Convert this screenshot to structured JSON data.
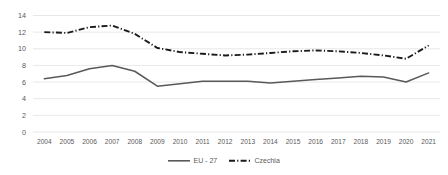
{
  "chart_data": {
    "type": "line",
    "title": "",
    "xlabel": "",
    "ylabel": "",
    "categories": [
      "2004",
      "2005",
      "2006",
      "2007",
      "2008",
      "2009",
      "2010",
      "2011",
      "2012",
      "2013",
      "2014",
      "2015",
      "2016",
      "2017",
      "2018",
      "2019",
      "2020",
      "2021"
    ],
    "ylim": [
      0,
      14
    ],
    "yticks": [
      0,
      2,
      4,
      6,
      8,
      10,
      12,
      14
    ],
    "ytick_labels": [
      "0",
      "2",
      "4",
      "6",
      "8",
      "10",
      "12",
      "14"
    ],
    "grid": true,
    "legend_position": "bottom-center",
    "series": [
      {
        "name": "EU - 27",
        "style": "solid",
        "color": "#595959",
        "values": [
          6.4,
          6.8,
          7.6,
          8.0,
          7.3,
          5.5,
          5.8,
          6.1,
          6.1,
          6.1,
          5.9,
          6.1,
          6.3,
          6.5,
          6.7,
          6.6,
          6.0,
          7.1
        ]
      },
      {
        "name": "Czechia",
        "style": "dash-dot",
        "color": "#1a1a1a",
        "values": [
          12.0,
          11.9,
          12.6,
          12.8,
          11.8,
          10.1,
          9.6,
          9.4,
          9.2,
          9.3,
          9.5,
          9.7,
          9.8,
          9.7,
          9.5,
          9.2,
          8.8,
          10.4
        ]
      }
    ]
  },
  "legend": {
    "items": [
      {
        "label": "EU - 27"
      },
      {
        "label": "Czechia"
      }
    ]
  },
  "colors": {
    "gridline": "#d9d9d9",
    "tick_text": "#595959",
    "eu_series": "#595959",
    "czechia_series": "#1a1a1a",
    "background": "#ffffff"
  }
}
